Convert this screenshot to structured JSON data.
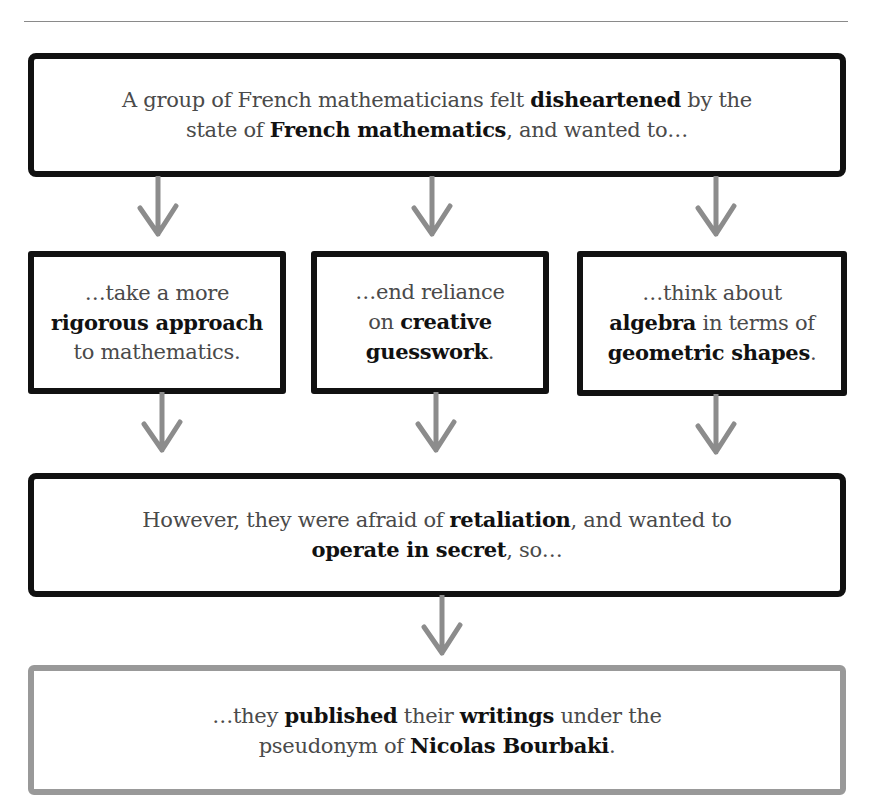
{
  "diagram": {
    "colors": {
      "box_border": "#111111",
      "final_box_border": "#999999",
      "arrow": "#8c8c8c",
      "text": "#4a4a4a",
      "bold_text": "#111111"
    },
    "top_box": {
      "line1_pre": "A group of French mathematicians felt ",
      "line1_bold": "disheartened",
      "line1_post": " by the",
      "line2_pre": "state of ",
      "line2_bold": "French mathematics",
      "line2_post": ", and wanted to…"
    },
    "middle_boxes": [
      {
        "line1": "…take a more",
        "line2_bold": "rigorous approach",
        "line3": "to mathematics."
      },
      {
        "line1": "…end reliance",
        "line2_pre": "on ",
        "line2_bold": "creative",
        "line3_bold": "guesswork",
        "line3_post": "."
      },
      {
        "line1": "…think about",
        "line2_bold": "algebra",
        "line2_post": " in terms of",
        "line3_bold": "geometric shapes",
        "line3_post": "."
      }
    ],
    "secret_box": {
      "line1_pre": "However, they were afraid of ",
      "line1_bold": "retaliation",
      "line1_post": ", and wanted to",
      "line2_bold": "operate in secret",
      "line2_post": ", so…"
    },
    "final_box": {
      "line1_pre": "…they ",
      "line1_bold1": "published",
      "line1_mid": " their ",
      "line1_bold2": "writings",
      "line1_post": " under the",
      "line2_pre": "pseudonym of ",
      "line2_bold": "Nicolas Bourbaki",
      "line2_post": "."
    },
    "arrows": [
      "arrow-down",
      "arrow-down",
      "arrow-down",
      "arrow-down",
      "arrow-down",
      "arrow-down",
      "arrow-down"
    ]
  }
}
